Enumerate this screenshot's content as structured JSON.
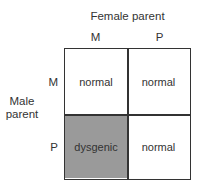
{
  "female_parent_label": "Female parent",
  "male_parent_label": "Male parent",
  "columns": [
    "M",
    "P"
  ],
  "rows": [
    "M",
    "P"
  ],
  "cells": [
    [
      {
        "text": "normal",
        "fill": "#ffffff"
      },
      {
        "text": "normal",
        "fill": "#ffffff"
      }
    ],
    [
      {
        "text": "dysgenic",
        "fill": "#9a9a9a"
      },
      {
        "text": "normal",
        "fill": "#ffffff"
      }
    ]
  ]
}
